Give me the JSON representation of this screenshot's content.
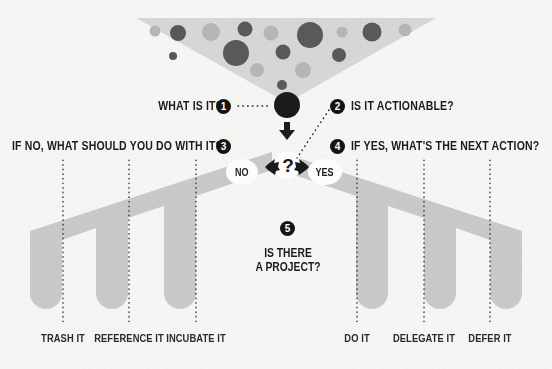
{
  "poster": {
    "title": "Getting Things Done Workflow",
    "background_color": "#f7f7f5",
    "ink_color": "#1b1b1b",
    "band_color": "#c9c9c9",
    "funnel_color": "#d6d6d4",
    "dot_dark_color": "#555555",
    "dot_light_color": "#b5b5b5"
  },
  "questions": [
    {
      "num": "1",
      "text": "WHAT IS IT?",
      "side": "left"
    },
    {
      "num": "2",
      "text": "IS IT ACTIONABLE?",
      "side": "right"
    },
    {
      "num": "3",
      "text": "IF NO, WHAT SHOULD YOU DO WITH IT?",
      "side": "left"
    },
    {
      "num": "4",
      "text": "IF YES, WHAT'S THE NEXT ACTION?",
      "side": "right"
    },
    {
      "num": "5",
      "text": "IS THERE A PROJECT?",
      "side": "center"
    }
  ],
  "decision": {
    "marker": "?",
    "no_label": "NO",
    "yes_label": "YES"
  },
  "project_question": {
    "num": "5",
    "line1": "IS THERE",
    "line2": "A PROJECT?"
  },
  "outcomes": {
    "no_branch": [
      {
        "label": "TRASH IT"
      },
      {
        "label": "REFERENCE IT"
      },
      {
        "label": "INCUBATE IT"
      }
    ],
    "yes_branch": [
      {
        "label": "DO IT"
      },
      {
        "label": "DELEGATE IT"
      },
      {
        "label": "DEFER IT"
      }
    ]
  }
}
